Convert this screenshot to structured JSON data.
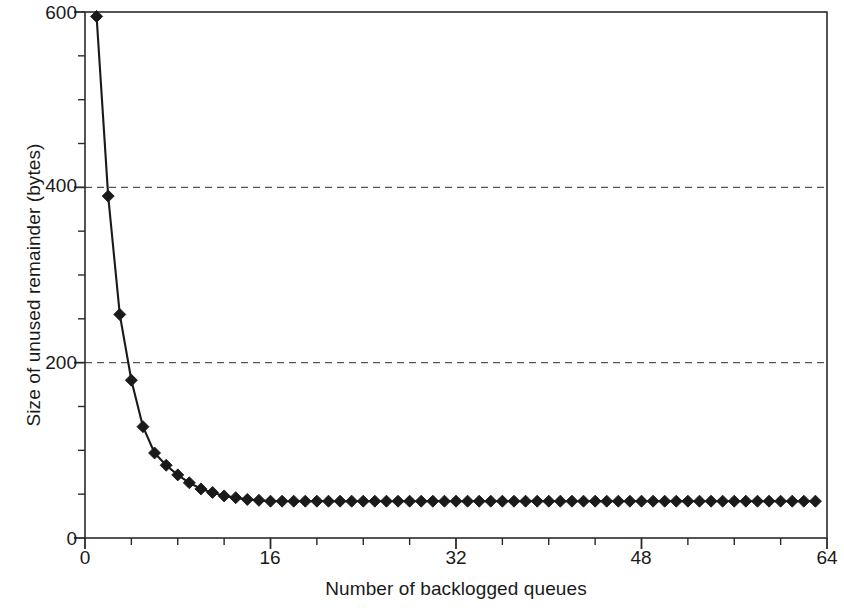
{
  "chart_data": {
    "type": "line",
    "title": "",
    "xlabel": "Number of backlogged queues",
    "ylabel": "Size of unused remainder (bytes)",
    "xlim": [
      0,
      64
    ],
    "ylim": [
      0,
      600
    ],
    "x_major_ticks": [
      0,
      16,
      32,
      48,
      64
    ],
    "x_major_tick_labels": [
      "0",
      "16",
      "32",
      "48",
      "64"
    ],
    "x_minor_tick_step": 4,
    "y_major_ticks": [
      0,
      200,
      400,
      600
    ],
    "y_major_tick_labels": [
      "0",
      "200",
      "400",
      "600"
    ],
    "y_minor_tick_step": 50,
    "grid": "horizontal dashed gridlines at y = 200 and y = 400",
    "gridlines": [
      200,
      400
    ],
    "legend": null,
    "marker": "filled black diamond",
    "line_color": "#1a1a1a",
    "marker_color": "#1a1a1a",
    "frame": "full rectangular box",
    "x": [
      1,
      2,
      3,
      4,
      5,
      6,
      7,
      8,
      9,
      10,
      11,
      12,
      13,
      14,
      15,
      16,
      17,
      18,
      19,
      20,
      21,
      22,
      23,
      24,
      25,
      26,
      27,
      28,
      29,
      30,
      31,
      32,
      33,
      34,
      35,
      36,
      37,
      38,
      39,
      40,
      41,
      42,
      43,
      44,
      45,
      46,
      47,
      48,
      49,
      50,
      51,
      52,
      53,
      54,
      55,
      56,
      57,
      58,
      59,
      60,
      61,
      62,
      63
    ],
    "values": [
      595,
      390,
      255,
      180,
      127,
      97,
      83,
      72,
      63,
      56,
      52,
      48,
      46,
      44,
      43,
      42,
      42,
      42,
      42,
      42,
      42,
      42,
      42,
      42,
      42,
      42,
      42,
      42,
      42,
      42,
      42,
      42,
      42,
      42,
      42,
      42,
      42,
      42,
      42,
      42,
      42,
      42,
      42,
      42,
      42,
      42,
      42,
      42,
      42,
      42,
      42,
      42,
      42,
      42,
      42,
      42,
      42,
      42,
      42,
      42,
      42,
      42,
      42
    ]
  },
  "axes": {
    "y_labels": [
      "600",
      "400",
      "200",
      "0"
    ],
    "x_labels": [
      "0",
      "16",
      "32",
      "48",
      "64"
    ],
    "xlabel": "Number of backlogged queues",
    "ylabel": "Size of unused remainder (bytes)"
  }
}
